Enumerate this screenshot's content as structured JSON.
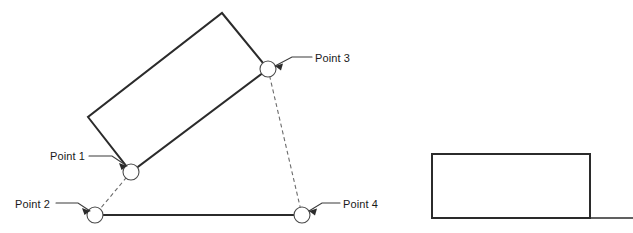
{
  "canvas": {
    "width": 633,
    "height": 233,
    "background": "#ffffff"
  },
  "colors": {
    "outline": "#2b2b2b",
    "dashed": "#6b6b6b",
    "marker_stroke": "#4a4a4a",
    "marker_fill": "#ffffff",
    "text": "#1a1a1a",
    "leader": "#3a3a3a"
  },
  "labels": {
    "point1": "Point 1",
    "point2": "Point 2",
    "point3": "Point 3",
    "point4": "Point 4"
  },
  "points": [
    {
      "name": "Point 1",
      "x": 131,
      "y": 172,
      "radius": 8
    },
    {
      "name": "Point 2",
      "x": 95,
      "y": 215,
      "radius": 8
    },
    {
      "name": "Point 3",
      "x": 268,
      "y": 69,
      "radius": 8
    },
    {
      "name": "Point 4",
      "x": 302,
      "y": 215,
      "radius": 8
    }
  ],
  "rotated_rectangle": {
    "corners": [
      {
        "x": 222,
        "y": 13
      },
      {
        "x": 268,
        "y": 69
      },
      {
        "x": 131,
        "y": 172
      },
      {
        "x": 88,
        "y": 117
      }
    ],
    "path": "M 222 13 L 268 69 L 131 172 L 88 117 Z"
  },
  "upright_rectangle": {
    "x": 432,
    "y": 154,
    "width": 158,
    "height": 64,
    "path": "M 432 154 L 590 154 L 590 218 L 432 218 Z"
  },
  "ground_line": {
    "x1": 432,
    "y1": 218,
    "x2": 633,
    "y2": 218
  },
  "baseline": {
    "from": "Point 2",
    "to": "Point 4",
    "x1": 95,
    "y1": 215,
    "x2": 302,
    "y2": 215
  },
  "dashed_connectors": [
    {
      "from": "Point 1",
      "to": "Point 2",
      "x1": 131,
      "y1": 172,
      "x2": 95,
      "y2": 215
    },
    {
      "from": "Point 3",
      "to": "Point 4",
      "x1": 268,
      "y1": 69,
      "x2": 302,
      "y2": 215
    }
  ],
  "leaders": [
    {
      "label": "Point 1",
      "text_x": 50,
      "text_y": 160,
      "line": "M 89 156 L 112 156 L 127 166",
      "arrow": "M 127 166 L 119 163 L 121.5 170 Z"
    },
    {
      "label": "Point 2",
      "text_x": 15,
      "text_y": 208,
      "line": "M 56 203 L 78 203 L 90 211",
      "arrow": "M 90 211 L 82 208 L 84.5 215 Z"
    },
    {
      "label": "Point 3",
      "text_x": 315,
      "text_y": 62,
      "line": "M 312 57 L 292 57 L 275 66",
      "arrow": "M 275 66 L 283 63.5 L 281 70.5 Z"
    },
    {
      "label": "Point 4",
      "text_x": 343,
      "text_y": 208,
      "line": "M 340 203 L 322 203 L 309 211",
      "arrow": "M 309 211 L 317 208.5 L 315 215.5 Z"
    }
  ]
}
